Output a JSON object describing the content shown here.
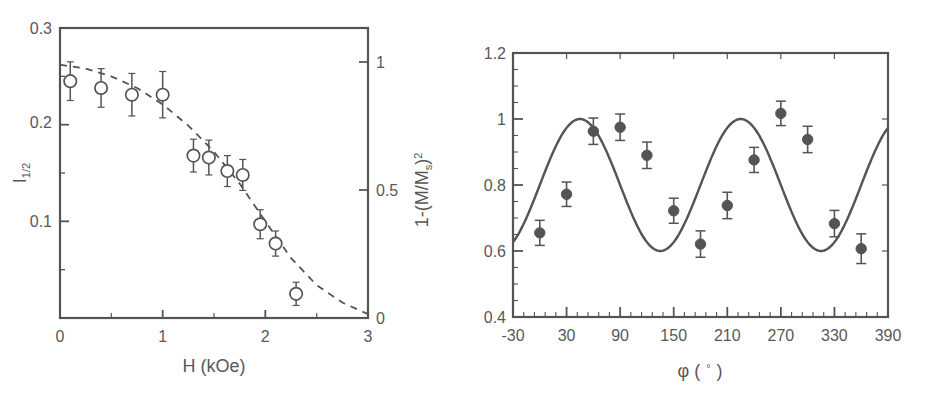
{
  "figure": {
    "background": "#ffffff",
    "ink": "#545454",
    "panels": [
      "left",
      "right"
    ]
  },
  "chart_data": [
    {
      "id": "left",
      "type": "scatter",
      "title": "",
      "xlabel": "H (kOe)",
      "ylabel": "I",
      "ylabel_sub": "1/2",
      "ylabel_full": "I_1/2",
      "y2label_prefix": "1-(M/M",
      "y2label_sub": "s",
      "y2label_suffix": ")",
      "y2label_sup": "2",
      "y2label_full": "1-(M/Ms)^2",
      "xlim": [
        0,
        3
      ],
      "ylim": [
        0,
        0.3
      ],
      "y2lim": [
        0,
        1.0
      ],
      "xticks": [
        0,
        1,
        2,
        3
      ],
      "xticklabels": [
        "0",
        "1",
        "2",
        "3"
      ],
      "yticks": [
        0.1,
        0.2,
        0.3
      ],
      "yticklabels": [
        "0.1",
        "0.2",
        "0.3"
      ],
      "y2ticks": [
        0,
        0.5,
        1
      ],
      "y2ticklabels": [
        "0",
        "0.5",
        "1"
      ],
      "grid": false,
      "legend": "none",
      "marker": "open-circle",
      "fit_style": "dashed",
      "x": [
        0.1,
        0.4,
        0.7,
        1.0,
        1.3,
        1.45,
        1.63,
        1.78,
        1.95,
        2.1,
        2.3
      ],
      "values": [
        0.245,
        0.238,
        0.231,
        0.231,
        0.168,
        0.166,
        0.152,
        0.148,
        0.097,
        0.077,
        0.025
      ],
      "yerr": [
        0.02,
        0.02,
        0.022,
        0.024,
        0.017,
        0.018,
        0.016,
        0.016,
        0.015,
        0.013,
        0.012
      ],
      "fit_x": [
        0.0,
        0.25,
        0.5,
        0.75,
        1.0,
        1.25,
        1.5,
        1.75,
        2.0,
        2.25,
        2.5,
        2.75,
        3.0
      ],
      "fit_y": [
        0.262,
        0.258,
        0.25,
        0.238,
        0.221,
        0.199,
        0.172,
        0.139,
        0.1,
        0.062,
        0.034,
        0.016,
        0.004
      ]
    },
    {
      "id": "right",
      "type": "scatter",
      "title": "",
      "xlabel_prefix": "φ (",
      "xlabel_unit": "°",
      "xlabel_suffix": ")",
      "xlabel_full": "φ ( ° )",
      "ylabel": "Normalized peak intensity",
      "xlim": [
        -30,
        390
      ],
      "ylim": [
        0.4,
        1.2
      ],
      "xticks": [
        -30,
        30,
        90,
        150,
        210,
        270,
        330,
        390
      ],
      "xticklabels": [
        "-30",
        "30",
        "90",
        "150",
        "210",
        "270",
        "330",
        "390"
      ],
      "xminorticks": 5,
      "yticks": [
        0.4,
        0.6,
        0.8,
        1.0,
        1.2
      ],
      "yticklabels": [
        "0.4",
        "0.6",
        "0.8",
        "1",
        "1.2"
      ],
      "yminorticks": 4,
      "grid": false,
      "legend": "none",
      "marker": "filled-circle",
      "fit_style": "solid",
      "x": [
        0,
        30,
        60,
        90,
        120,
        150,
        180,
        210,
        240,
        270,
        300,
        330,
        360
      ],
      "values": [
        0.655,
        0.772,
        0.963,
        0.975,
        0.89,
        0.722,
        0.621,
        0.738,
        0.876,
        1.017,
        0.938,
        0.683,
        0.607
      ],
      "yerr": [
        0.038,
        0.037,
        0.04,
        0.04,
        0.04,
        0.038,
        0.04,
        0.04,
        0.038,
        0.037,
        0.04,
        0.04,
        0.045
      ],
      "fit_formula": "0.8 + 0.2*sin(2*phi)",
      "fit_amplitude": 0.2,
      "fit_offset": 0.8,
      "fit_period": 180
    }
  ]
}
